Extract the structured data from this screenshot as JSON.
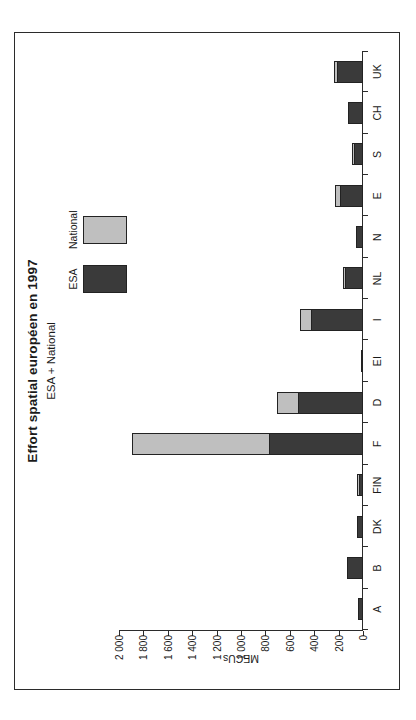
{
  "figure": {
    "title": "Effort spatial européen en 1997",
    "subtitle": "ESA + National"
  },
  "legend": {
    "position": "top-right",
    "entries": [
      {
        "label": "ESA",
        "color": "#3a3a3a"
      },
      {
        "label": "National",
        "color": "#bfbfbf"
      }
    ]
  },
  "colors": {
    "esa": "#3a3a3a",
    "national": "#bfbfbf",
    "axis": "#2b2b2b",
    "background": "#ffffff"
  },
  "chart_data": {
    "type": "bar",
    "stacked": true,
    "orientation": "vertical",
    "title": "Effort spatial européen en 1997",
    "subtitle": "ESA + National",
    "xlabel": "",
    "ylabel": "MECUs",
    "ylim": [
      0,
      2000
    ],
    "ytick_step": 200,
    "yticks": [
      0,
      200,
      400,
      600,
      800,
      1000,
      1200,
      1400,
      1600,
      1800,
      2000
    ],
    "ytick_labels": [
      "0",
      "200",
      "400",
      "600",
      "800",
      "1 000",
      "1 200",
      "1 400",
      "1 600",
      "1 800",
      "2 000"
    ],
    "grid": false,
    "legend_position": "top-right",
    "categories": [
      "A",
      "B",
      "DK",
      "FIN",
      "F",
      "D",
      "EI",
      "I",
      "NL",
      "N",
      "E",
      "S",
      "CH",
      "UK"
    ],
    "series": [
      {
        "name": "ESA",
        "color": "#3a3a3a",
        "values": [
          45,
          130,
          50,
          30,
          770,
          535,
          12,
          425,
          145,
          55,
          185,
          70,
          120,
          210
        ]
      },
      {
        "name": "National",
        "color": "#bfbfbf",
        "values": [
          0,
          0,
          0,
          8,
          1120,
          170,
          0,
          90,
          20,
          0,
          45,
          10,
          0,
          25
        ]
      }
    ],
    "totals": [
      45,
      130,
      50,
      38,
      1890,
      705,
      12,
      515,
      165,
      55,
      230,
      80,
      120,
      235
    ]
  }
}
